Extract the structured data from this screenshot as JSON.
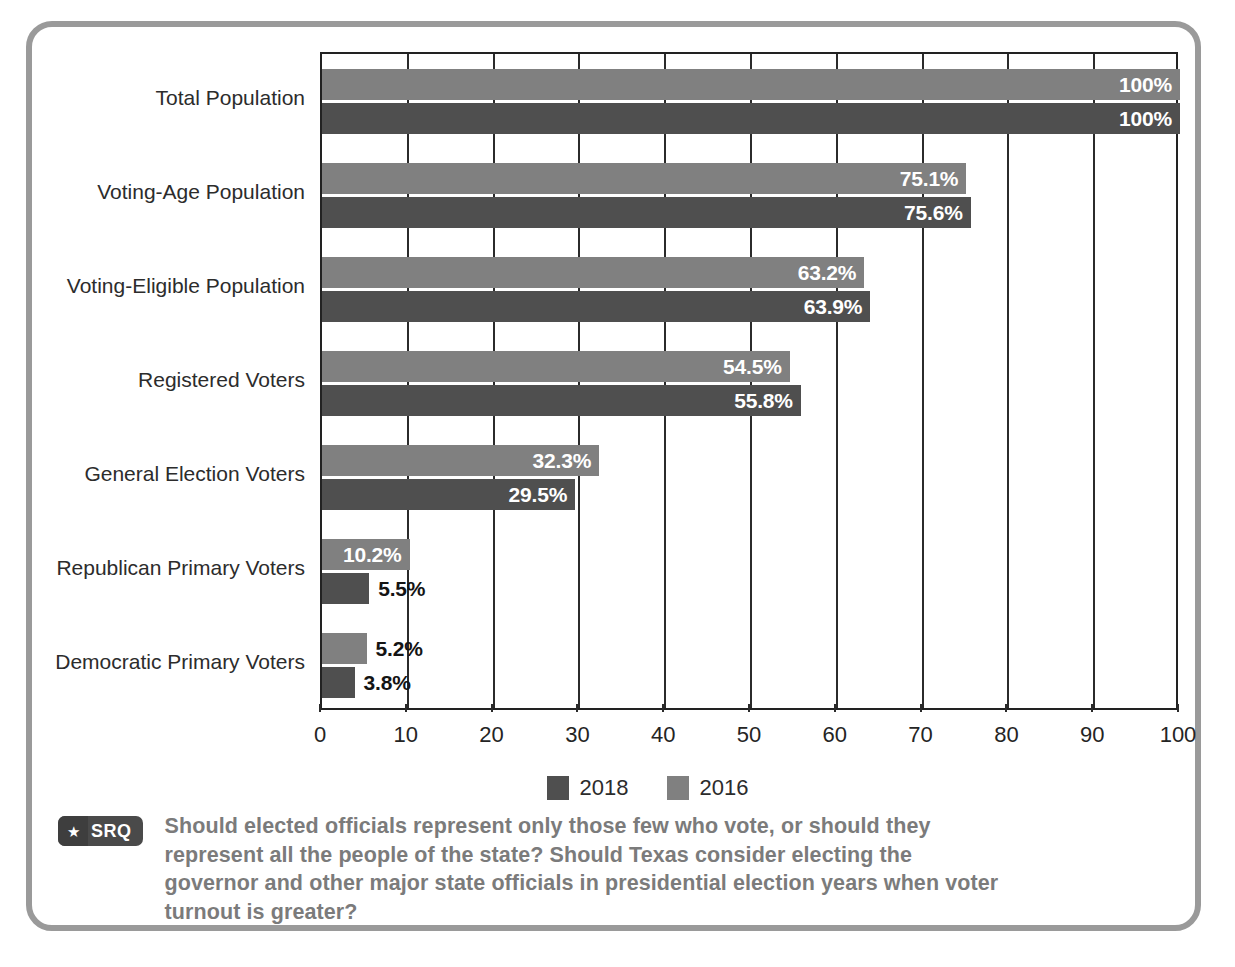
{
  "chart_data": {
    "type": "bar",
    "orientation": "horizontal",
    "title": "",
    "xlabel": "",
    "ylabel": "",
    "xlim": [
      0,
      100
    ],
    "xticks": [
      0,
      10,
      20,
      30,
      40,
      50,
      60,
      70,
      80,
      90,
      100
    ],
    "xtick_labels": [
      "0",
      "10",
      "20",
      "30",
      "40",
      "50",
      "60",
      "70",
      "80",
      "90",
      "100"
    ],
    "grid": true,
    "grid_axis": "x",
    "legend_position": "bottom-center",
    "categories": [
      "Total Population",
      "Voting-Age Population",
      "Voting-Eligible Population",
      "Registered Voters",
      "General Election Voters",
      "Republican Primary Voters",
      "Democratic Primary Voters"
    ],
    "series": [
      {
        "name": "2016",
        "color": "#808080",
        "values": [
          100,
          75.1,
          63.2,
          54.5,
          32.3,
          10.2,
          5.2
        ],
        "labels": [
          "100%",
          "75.1%",
          "63.2%",
          "54.5%",
          "32.3%",
          "10.2%",
          "5.2%"
        ],
        "label_placement": [
          "inside",
          "inside",
          "inside",
          "inside",
          "inside",
          "inside",
          "outside"
        ]
      },
      {
        "name": "2018",
        "color": "#4f4f4f",
        "values": [
          100,
          75.6,
          63.9,
          55.8,
          29.5,
          5.5,
          3.8
        ],
        "labels": [
          "100%",
          "75.6%",
          "63.9%",
          "55.8%",
          "29.5%",
          "5.5%",
          "3.8%"
        ],
        "label_placement": [
          "inside",
          "inside",
          "inside",
          "inside",
          "inside",
          "outside",
          "outside"
        ]
      }
    ]
  },
  "legend": {
    "items": [
      {
        "label": "2018",
        "color": "#4f4f4f"
      },
      {
        "label": "2016",
        "color": "#808080"
      }
    ]
  },
  "srq": {
    "badge_text": "SRQ",
    "badge_icon": "star-icon",
    "question": "Should elected officials represent only those few who vote, or should they represent all the people of the state? Should Texas consider electing the governor and other major state officials in presidential election years when voter turnout is greater?"
  },
  "colors": {
    "series_2016": "#808080",
    "series_2018": "#4f4f4f",
    "frame": "#9a9a9a",
    "axis": "#222222",
    "question_text": "#7b7b7b"
  }
}
